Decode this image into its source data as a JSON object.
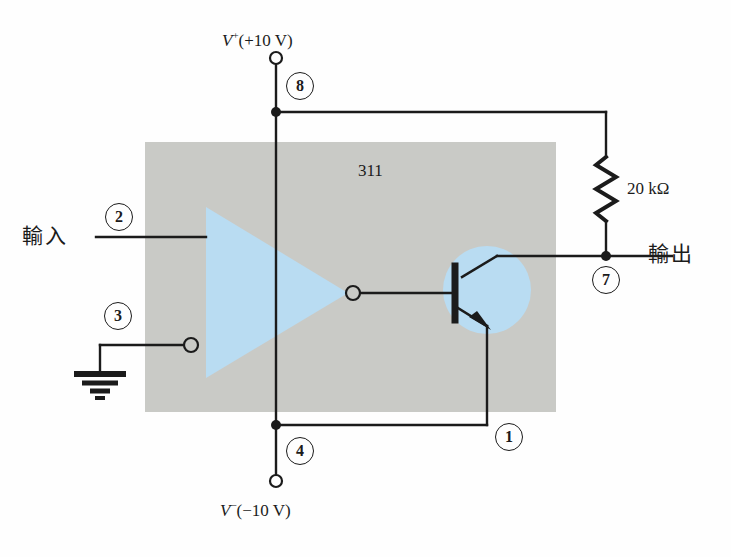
{
  "diagram": {
    "part_label": "311",
    "colors": {
      "wire": "#1b1b1b",
      "chip_body": "#c9cac6",
      "opamp_fill": "#b9dcf2",
      "transistor_fill": "#b9dcf2",
      "background": "#fefefe"
    },
    "supplies": {
      "positive": {
        "symbol": "V",
        "sign": "+",
        "value": "(+10 V)"
      },
      "negative": {
        "symbol": "V",
        "sign": "−",
        "value": "(−10 V)"
      }
    },
    "signals": {
      "input_label": "輸入",
      "output_label": "輸出"
    },
    "components": {
      "resistor_label": "20 kΩ"
    },
    "pins": [
      {
        "number": "8",
        "name": "pin-8-vplus"
      },
      {
        "number": "2",
        "name": "pin-2-input"
      },
      {
        "number": "3",
        "name": "pin-3-ground"
      },
      {
        "number": "4",
        "name": "pin-4-vminus"
      },
      {
        "number": "1",
        "name": "pin-1-emitter"
      },
      {
        "number": "7",
        "name": "pin-7-output"
      }
    ],
    "pin_by_index": {
      "p8": "8",
      "p2": "2",
      "p3": "3",
      "p4": "4",
      "p1": "1",
      "p7": "7"
    }
  }
}
